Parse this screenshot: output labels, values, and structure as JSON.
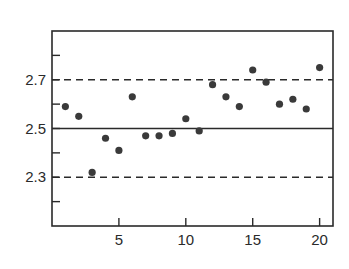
{
  "chart_data": {
    "type": "scatter",
    "title": "",
    "xlabel": "",
    "ylabel": "",
    "x": [
      1,
      2,
      3,
      4,
      5,
      6,
      7,
      8,
      9,
      10,
      11,
      12,
      13,
      14,
      15,
      16,
      17,
      18,
      19,
      20
    ],
    "series": [
      {
        "name": "observations",
        "values": [
          2.59,
          2.55,
          2.32,
          2.46,
          2.41,
          2.63,
          2.47,
          2.47,
          2.48,
          2.54,
          2.49,
          2.68,
          2.63,
          2.59,
          2.74,
          2.69,
          2.6,
          2.62,
          2.58,
          2.75
        ]
      }
    ],
    "reference_lines": [
      {
        "name": "upper-control-limit",
        "y": 2.7,
        "style": "dashed"
      },
      {
        "name": "center-line",
        "y": 2.5,
        "style": "solid"
      },
      {
        "name": "lower-control-limit",
        "y": 2.3,
        "style": "dashed"
      }
    ],
    "xlim": [
      0,
      21
    ],
    "ylim": [
      2.1,
      2.9
    ],
    "x_ticks": [
      5,
      10,
      15,
      20
    ],
    "x_tick_labels": [
      "5",
      "10",
      "15",
      "20"
    ],
    "y_ticks": [
      2.2,
      2.3,
      2.4,
      2.5,
      2.6,
      2.7,
      2.8
    ],
    "y_tick_labels": [
      "",
      "2.3",
      "",
      "2.5",
      "",
      "2.7",
      ""
    ],
    "grid": false,
    "legend": null
  }
}
